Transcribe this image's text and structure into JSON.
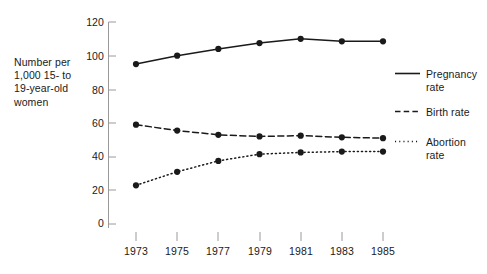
{
  "chart_data": {
    "type": "line",
    "title": "",
    "subtitle": "",
    "xlabel": "",
    "ylabel": "Number per\n1,000 15- to\n19-year-old\nwomen",
    "categories": [
      "1973",
      "1975",
      "1977",
      "1979",
      "1981",
      "1983",
      "1985"
    ],
    "x": [
      1973,
      1975,
      1977,
      1979,
      1981,
      1983,
      1985
    ],
    "xlim": [
      1972,
      1986
    ],
    "ylim": [
      0,
      120
    ],
    "yticks": [
      0,
      20,
      40,
      60,
      80,
      100,
      120
    ],
    "ytick_labels": [
      "0",
      "20",
      "40",
      "60",
      "80",
      "100",
      "120"
    ],
    "grid": false,
    "legend_position": "right",
    "marker": "filled-circle",
    "series": [
      {
        "name": "Pregnancy\nrate",
        "legend_label": "Pregnancy\nrate",
        "style": "solid",
        "color": "#1a1a1a",
        "values": [
          95,
          100,
          104,
          107.5,
          110,
          108.5,
          108.5
        ]
      },
      {
        "name": "Birth  rate",
        "legend_label": "Birth  rate",
        "style": "dashed",
        "color": "#1a1a1a",
        "values": [
          59,
          55.5,
          53,
          52,
          52.5,
          51.5,
          51
        ]
      },
      {
        "name": "Abortion\nrate",
        "legend_label": "Abortion\nrate",
        "style": "dotted",
        "color": "#1a1a1a",
        "values": [
          23,
          31,
          37.5,
          41.5,
          42.5,
          43,
          43
        ]
      }
    ]
  },
  "axis": {
    "y_label_line1": "Number per",
    "y_label_line2": "1,000 15- to",
    "y_label_line3": "19-year-old",
    "y_label_line4": "women",
    "ytick_0": "0",
    "ytick_1": "20",
    "ytick_2": "40",
    "ytick_3": "60",
    "ytick_4": "80",
    "ytick_5": "100",
    "ytick_6": "120",
    "xtick_0": "1973",
    "xtick_1": "1975",
    "xtick_2": "1977",
    "xtick_3": "1979",
    "xtick_4": "1981",
    "xtick_5": "1983",
    "xtick_6": "1985"
  },
  "legend": {
    "items": [
      {
        "label": "Pregnancy\nrate",
        "style": "solid"
      },
      {
        "label": "Birth  rate",
        "style": "dashed"
      },
      {
        "label": "Abortion\nrate",
        "style": "dotted"
      }
    ]
  },
  "colors": {
    "ink": "#1a1a1a",
    "axis": "#9a9a9a",
    "background": "#ffffff"
  }
}
